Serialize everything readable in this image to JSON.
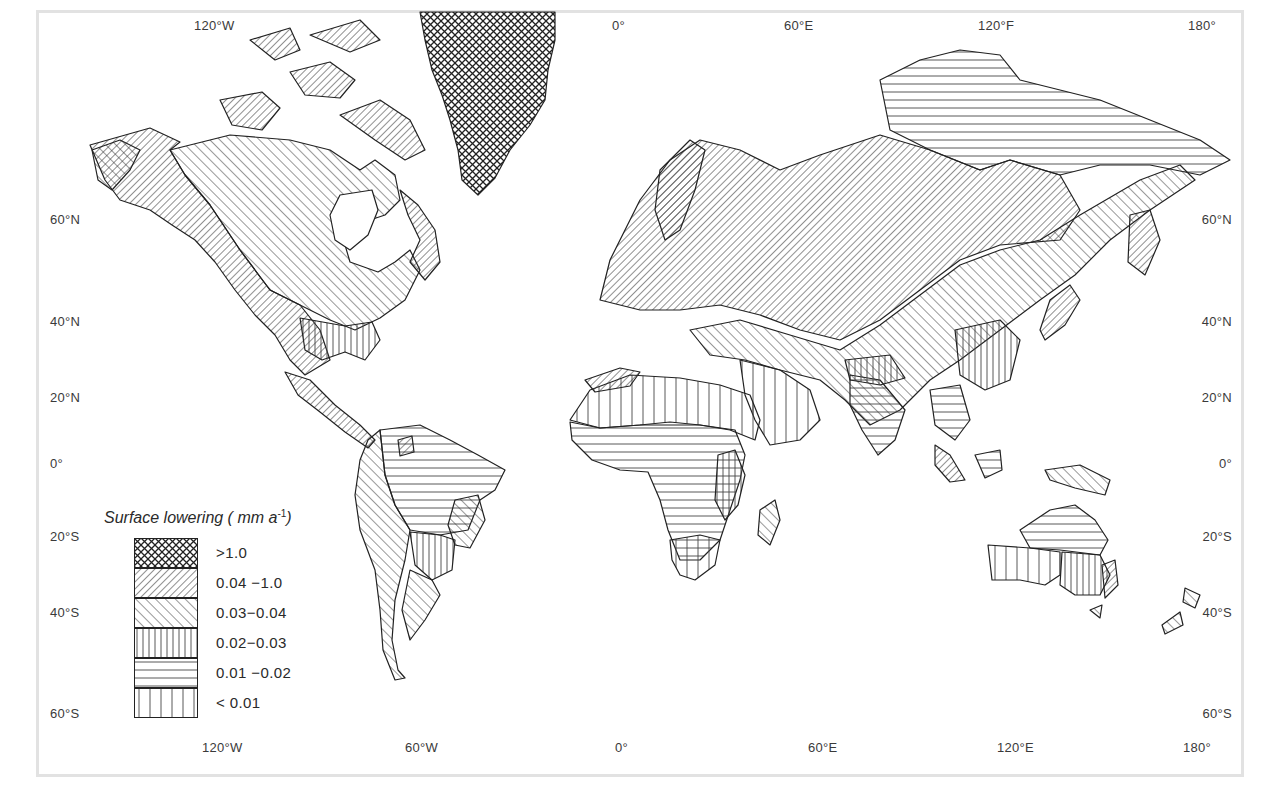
{
  "map": {
    "title": "Surface lowering",
    "legend": {
      "title": "Surface lowering ( mm a",
      "title_exponent": "-1",
      "title_close": ")",
      "items": [
        {
          "label": ">1.0",
          "pattern": "crosshatch"
        },
        {
          "label": "0.04 −1.0",
          "pattern": "diagonal-forward-dense"
        },
        {
          "label": "0.03−0.04",
          "pattern": "diagonal-backward"
        },
        {
          "label": "0.02−0.03",
          "pattern": "vertical-dense"
        },
        {
          "label": "0.01 −0.02",
          "pattern": "horizontal"
        },
        {
          "label": "< 0.01",
          "pattern": "vertical-sparse"
        }
      ]
    },
    "axes": {
      "top_longitudes": [
        "120°W",
        "0°",
        "60°E",
        "120°F",
        "180°"
      ],
      "bottom_longitudes": [
        "120°W",
        "60°W",
        "0°",
        "60°E",
        "120°E",
        "180°"
      ],
      "left_latitudes": [
        "60°N",
        "40°N",
        "20°N",
        "0°",
        "20°S",
        "40°S",
        "60°S"
      ],
      "right_latitudes": [
        "60°N",
        "40°N",
        "20°N",
        "0°",
        "20°S",
        "40°S",
        "60°S"
      ]
    },
    "colors": {
      "ink": "#2a2a2a",
      "frame": "#e2e2e2",
      "background": "#ffffff"
    }
  }
}
